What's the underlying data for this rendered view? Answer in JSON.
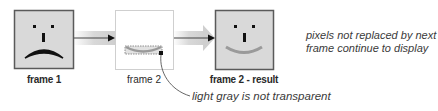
{
  "diagram": {
    "frames": [
      {
        "id": "frame1",
        "label": "frame 1",
        "expression": "frown",
        "fill": "#d9d9d9"
      },
      {
        "id": "frame2",
        "label": "frame 2",
        "expression": "partial-smile-patch",
        "fill": "#ffffff"
      },
      {
        "id": "result",
        "label": "frame 2 - result",
        "expression": "smile",
        "fill": "#d9d9d9"
      }
    ],
    "annotations": {
      "right_note_line1": "pixels not replaced by next",
      "right_note_line2": "frame continue to display",
      "callout": "light gray is not transparent"
    },
    "colors": {
      "frame_border": "#8a8a8a",
      "frame_fill": "#d9d9d9",
      "arrow_band": "#d4d4d4",
      "arrow_line": "#333333",
      "smile": "#9a9a9a",
      "face_dark": "#111111"
    }
  }
}
